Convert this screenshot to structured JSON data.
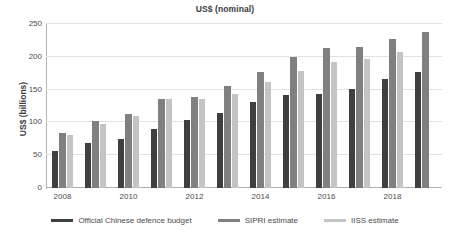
{
  "chart_data": {
    "type": "bar",
    "title": "US$ (nominal)",
    "xlabel": "",
    "ylabel": "US$ (billions)",
    "ylim": [
      0,
      250
    ],
    "yticks": [
      0,
      50,
      100,
      150,
      200,
      250
    ],
    "grid": true,
    "legend_position": "bottom",
    "categories": [
      "2008",
      "2009",
      "2010",
      "2011",
      "2012",
      "2013",
      "2014",
      "2015",
      "2016",
      "2017",
      "2018",
      "2019"
    ],
    "tick_labels": [
      "2008",
      "",
      "2010",
      "",
      "2012",
      "",
      "2014",
      "",
      "2016",
      "",
      "2018",
      ""
    ],
    "series": [
      {
        "name": "Official Chinese defence budget",
        "color": "#3f3f3f",
        "values": [
          57,
          68,
          75,
          90,
          103,
          115,
          131,
          142,
          143,
          151,
          166,
          177
        ]
      },
      {
        "name": "SIPRI estimate",
        "color": "#808080",
        "values": [
          84,
          102,
          113,
          136,
          138,
          155,
          177,
          199,
          214,
          215,
          227,
          238
        ]
      },
      {
        "name": "IISS estimate",
        "color": "#c4c4c4",
        "values": [
          81,
          97,
          110,
          135,
          135,
          144,
          161,
          179,
          192,
          196,
          207,
          null
        ]
      }
    ]
  },
  "legend": {
    "items": [
      {
        "label": "Official Chinese defence budget"
      },
      {
        "label": "SIPRI estimate"
      },
      {
        "label": "IISS estimate"
      }
    ]
  }
}
